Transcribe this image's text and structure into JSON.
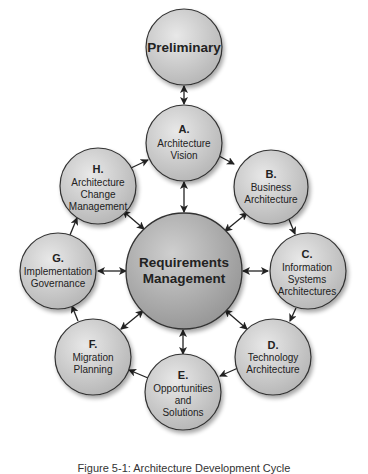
{
  "diagram": {
    "preliminary": {
      "label": "Preliminary"
    },
    "center": {
      "line1": "Requirements",
      "line2": "Management"
    },
    "phases": [
      {
        "letter": "A.",
        "lines": [
          "Architecture",
          "Vision"
        ]
      },
      {
        "letter": "B.",
        "lines": [
          "Business",
          "Architecture"
        ]
      },
      {
        "letter": "C.",
        "lines": [
          "Information",
          "Systems",
          "Architectures"
        ]
      },
      {
        "letter": "D.",
        "lines": [
          "Technology",
          "Architecture"
        ]
      },
      {
        "letter": "E.",
        "lines": [
          "Opportunities",
          "and",
          "Solutions"
        ]
      },
      {
        "letter": "F.",
        "lines": [
          "Migration",
          "Planning"
        ]
      },
      {
        "letter": "G.",
        "lines": [
          "Implementation",
          "Governance"
        ]
      },
      {
        "letter": "H.",
        "lines": [
          "Architecture",
          "Change",
          "Management"
        ]
      }
    ],
    "colors": {
      "circle_fill_light": "#e4e4e4",
      "circle_fill_dark": "#b8b8b8",
      "center_fill_light": "#c9c9c9",
      "center_fill_dark": "#9c9c9c",
      "stroke": "#333333",
      "arrow": "#222222"
    }
  },
  "caption": "Figure 5-1: Architecture Development Cycle"
}
